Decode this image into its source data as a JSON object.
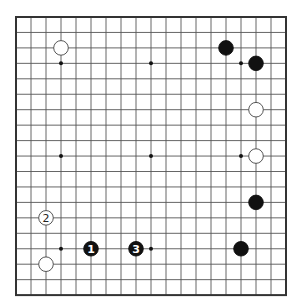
{
  "board": {
    "size": 19,
    "origin_x": 16,
    "origin_y": 17,
    "step_x": 15.0,
    "step_y": 15.45,
    "line_color": "#555555",
    "border_color": "#333333",
    "star_points": [
      [
        3,
        3
      ],
      [
        9,
        3
      ],
      [
        15,
        3
      ],
      [
        3,
        9
      ],
      [
        9,
        9
      ],
      [
        15,
        9
      ],
      [
        3,
        15
      ],
      [
        9,
        15
      ],
      [
        15,
        15
      ]
    ]
  },
  "stones": [
    {
      "color": "white",
      "col": 3,
      "row": 2,
      "label": ""
    },
    {
      "color": "black",
      "col": 14,
      "row": 2,
      "label": ""
    },
    {
      "color": "black",
      "col": 16,
      "row": 3,
      "label": ""
    },
    {
      "color": "white",
      "col": 16,
      "row": 6,
      "label": ""
    },
    {
      "color": "white",
      "col": 16,
      "row": 9,
      "label": ""
    },
    {
      "color": "black",
      "col": 16,
      "row": 12,
      "label": ""
    },
    {
      "color": "black",
      "col": 15,
      "row": 15,
      "label": ""
    },
    {
      "color": "white",
      "col": 2,
      "row": 13,
      "label": "2"
    },
    {
      "color": "white",
      "col": 2,
      "row": 16,
      "label": ""
    },
    {
      "color": "black",
      "col": 5,
      "row": 15,
      "label": "1"
    },
    {
      "color": "black",
      "col": 8,
      "row": 15,
      "label": "3"
    }
  ]
}
